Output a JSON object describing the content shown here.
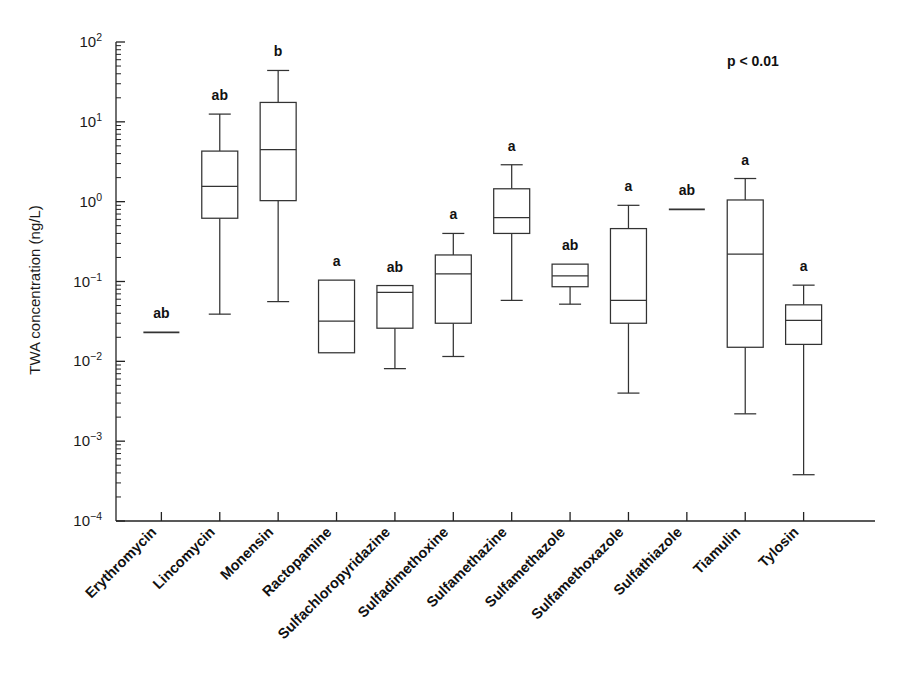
{
  "chart_data": {
    "type": "box",
    "title": "",
    "xlabel": "",
    "ylabel": "TWA concentration (ng/L)",
    "yscale": "log",
    "ylim": [
      0.0001,
      100
    ],
    "ytick_labels": [
      "10−4",
      "10−3",
      "10−2",
      "10−1",
      "10⁰",
      "10¹",
      "10²"
    ],
    "ytick_mantissa": "10",
    "ytick_exponents": [
      "-4",
      "-3",
      "-2",
      "-1",
      "0",
      "1",
      "2"
    ],
    "grid": false,
    "legend": "none",
    "annotations": [
      {
        "name": "p-value",
        "text": "p < 0.01"
      }
    ],
    "categories": [
      "Erythromycin",
      "Lincomycin",
      "Monensin",
      "Ractopamine",
      "Sulfachloropyridazine",
      "Sulfadimethoxine",
      "Sulfamethazine",
      "Sulfamethazole",
      "Sulfamethoxazole",
      "Sulfathiazole",
      "Tiamulin",
      "Tylosin"
    ],
    "group_letters": [
      "ab",
      "ab",
      "b",
      "a",
      "ab",
      "a",
      "a",
      "ab",
      "a",
      "ab",
      "a",
      "a"
    ],
    "boxes": [
      {
        "category": "Erythromycin",
        "group": "ab",
        "single_value": 0.023,
        "whisker_low": null,
        "q1": null,
        "median": 0.023,
        "q3": null,
        "whisker_high": null
      },
      {
        "category": "Lincomycin",
        "group": "ab",
        "single_value": null,
        "whisker_low": 0.039,
        "q1": 0.62,
        "median": 1.55,
        "q3": 4.3,
        "whisker_high": 12.5
      },
      {
        "category": "Monensin",
        "group": "b",
        "single_value": null,
        "whisker_low": 0.056,
        "q1": 1.03,
        "median": 4.5,
        "q3": 17.5,
        "whisker_high": 44.0
      },
      {
        "category": "Ractopamine",
        "group": "a",
        "single_value": null,
        "whisker_low": 0.0128,
        "q1": 0.0128,
        "median": 0.032,
        "q3": 0.104,
        "whisker_high": 0.104
      },
      {
        "category": "Sulfachloropyridazine",
        "group": "ab",
        "single_value": null,
        "whisker_low": 0.0081,
        "q1": 0.026,
        "median": 0.073,
        "q3": 0.089,
        "whisker_high": 0.089
      },
      {
        "category": "Sulfadimethoxine",
        "group": "a",
        "single_value": null,
        "whisker_low": 0.0115,
        "q1": 0.03,
        "median": 0.125,
        "q3": 0.215,
        "whisker_high": 0.4
      },
      {
        "category": "Sulfamethazine",
        "group": "a",
        "single_value": null,
        "whisker_low": 0.058,
        "q1": 0.4,
        "median": 0.63,
        "q3": 1.45,
        "whisker_high": 2.9
      },
      {
        "category": "Sulfamethazole",
        "group": "ab",
        "single_value": null,
        "whisker_low": 0.052,
        "q1": 0.086,
        "median": 0.118,
        "q3": 0.165,
        "whisker_high": 0.165
      },
      {
        "category": "Sulfamethoxazole",
        "group": "a",
        "single_value": null,
        "whisker_low": 0.004,
        "q1": 0.03,
        "median": 0.058,
        "q3": 0.46,
        "whisker_high": 0.9
      },
      {
        "category": "Sulfathiazole",
        "group": "ab",
        "single_value": 0.8,
        "whisker_low": null,
        "q1": null,
        "median": 0.8,
        "q3": null,
        "whisker_high": null
      },
      {
        "category": "Tiamulin",
        "group": "a",
        "single_value": null,
        "whisker_low": 0.0022,
        "q1": 0.015,
        "median": 0.22,
        "q3": 1.05,
        "whisker_high": 1.95
      },
      {
        "category": "Tylosin",
        "group": "a",
        "single_value": null,
        "whisker_low": 0.00038,
        "q1": 0.0163,
        "median": 0.0325,
        "q3": 0.051,
        "whisker_high": 0.09
      }
    ]
  }
}
